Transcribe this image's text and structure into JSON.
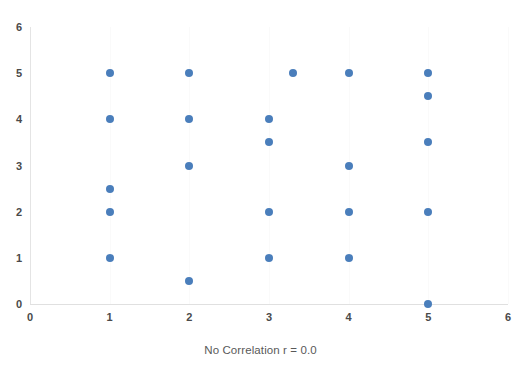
{
  "chart_data": {
    "type": "scatter",
    "title": "",
    "subtitle": "",
    "xlabel": "No Correlation r = 0.0",
    "ylabel": "",
    "xlim": [
      0,
      6
    ],
    "ylim": [
      0,
      6
    ],
    "xticks": [
      0,
      1,
      2,
      3,
      4,
      5,
      6
    ],
    "yticks": [
      0,
      1,
      2,
      3,
      4,
      5,
      6
    ],
    "xtick_labels": [
      "0",
      "1",
      "2",
      "3",
      "4",
      "5",
      "6"
    ],
    "ytick_labels": [
      "0",
      "1",
      "2",
      "3",
      "4",
      "5",
      "6"
    ],
    "grid": false,
    "legend": false,
    "legend_position": "none",
    "marker": "circle",
    "marker_color": "#4a7ebb",
    "marker_size": 8,
    "series": [
      {
        "name": "data",
        "color": "#4a7ebb",
        "points": [
          {
            "x": 1,
            "y": 5
          },
          {
            "x": 1,
            "y": 4
          },
          {
            "x": 1,
            "y": 2.5
          },
          {
            "x": 1,
            "y": 2
          },
          {
            "x": 1,
            "y": 1
          },
          {
            "x": 2,
            "y": 5
          },
          {
            "x": 2,
            "y": 4
          },
          {
            "x": 2,
            "y": 3
          },
          {
            "x": 2,
            "y": 0.5
          },
          {
            "x": 3,
            "y": 4
          },
          {
            "x": 3,
            "y": 3.5
          },
          {
            "x": 3,
            "y": 2
          },
          {
            "x": 3,
            "y": 1
          },
          {
            "x": 3.3,
            "y": 5
          },
          {
            "x": 4,
            "y": 5
          },
          {
            "x": 4,
            "y": 3
          },
          {
            "x": 4,
            "y": 2
          },
          {
            "x": 4,
            "y": 1
          },
          {
            "x": 5,
            "y": 5
          },
          {
            "x": 5,
            "y": 4.5
          },
          {
            "x": 5,
            "y": 3.5
          },
          {
            "x": 5,
            "y": 2
          },
          {
            "x": 5,
            "y": 0
          }
        ]
      }
    ],
    "annotations": [],
    "point_count": 23
  },
  "colors": {
    "marker": "#4a7ebb",
    "axis": "#e0e0e0",
    "tick_text": "#4a4a4a",
    "title_text": "#595959",
    "background": "#ffffff"
  }
}
